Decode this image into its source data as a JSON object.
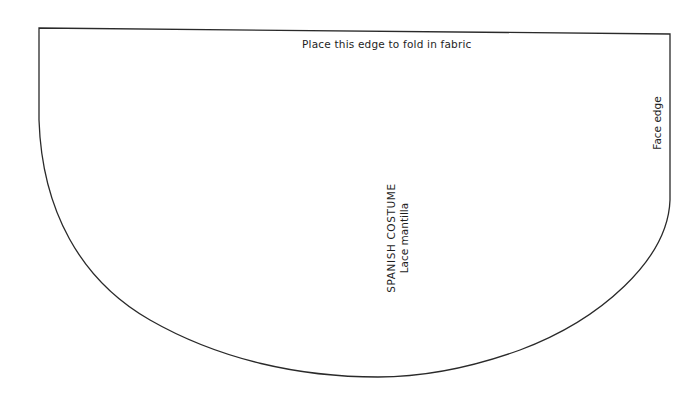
{
  "diagram": {
    "type": "sewing-pattern-piece",
    "labels": {
      "fold_edge": "Place this edge to fold in fabric",
      "title": "SPANISH COSTUME",
      "subtitle": "Lace mantilla",
      "face_edge": "Face edge"
    },
    "colors": {
      "outline": "#2a2a2a",
      "background": "#ffffff",
      "text": "#1e1e1e"
    }
  }
}
